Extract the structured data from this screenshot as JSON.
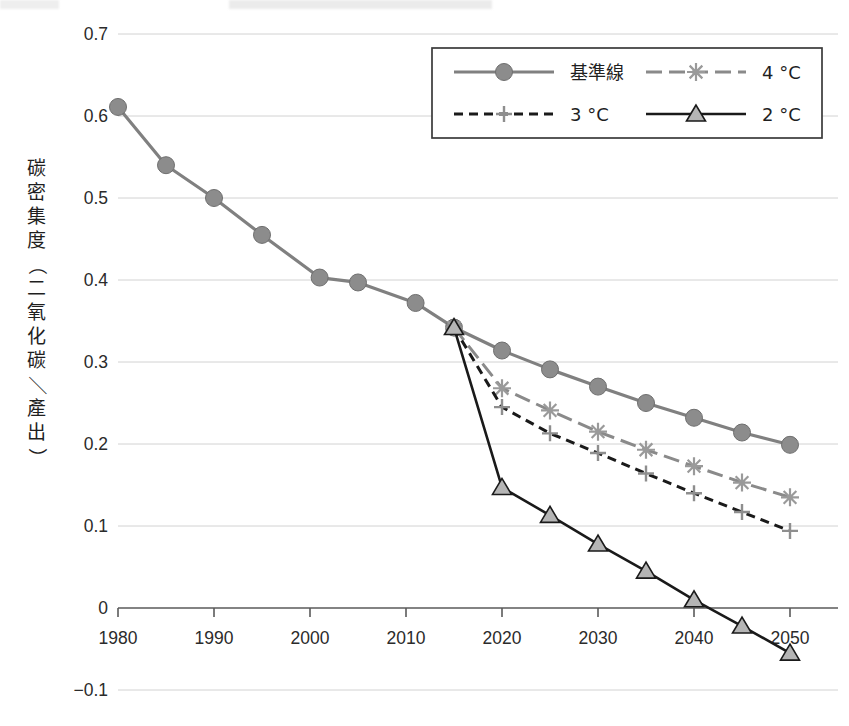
{
  "chart_data": {
    "type": "line",
    "title": "",
    "xlabel": "",
    "ylabel": "碳密集度（二氧化碳／產出）",
    "xlim": [
      1980,
      2050
    ],
    "ylim": [
      -0.1,
      0.7
    ],
    "xticks": [
      "1980",
      "1990",
      "2000",
      "2010",
      "2020",
      "2030",
      "2040",
      "2050"
    ],
    "xtick_values": [
      1980,
      1990,
      2000,
      2010,
      2020,
      2030,
      2040,
      2050
    ],
    "yticks": [
      "0.7",
      "0.6",
      "0.5",
      "0.4",
      "0.3",
      "0.2",
      "0.1",
      "0",
      "-0.1"
    ],
    "ytick_values": [
      0.7,
      0.6,
      0.5,
      0.4,
      0.3,
      0.2,
      0.1,
      0,
      -0.1
    ],
    "grid": "horizontal",
    "legend_position": "top-right",
    "series": [
      {
        "name": "基準線",
        "marker": "circle",
        "linestyle": "solid",
        "color": "#808080",
        "x": [
          1980,
          1985,
          1990,
          1995,
          2001,
          2005,
          2011,
          2015,
          2020,
          2025,
          2030,
          2035,
          2040,
          2045,
          2050
        ],
        "values": [
          0.611,
          0.54,
          0.5,
          0.455,
          0.403,
          0.397,
          0.372,
          0.342,
          0.314,
          0.291,
          0.27,
          0.25,
          0.232,
          0.214,
          0.199
        ]
      },
      {
        "name": "4 °C",
        "marker": "asterisk",
        "linestyle": "dashed",
        "color": "#8a8a8a",
        "x": [
          2015,
          2020,
          2025,
          2030,
          2035,
          2040,
          2045,
          2050
        ],
        "values": [
          0.342,
          0.268,
          0.241,
          0.215,
          0.193,
          0.173,
          0.153,
          0.135
        ]
      },
      {
        "name": "3 °C",
        "marker": "plus",
        "linestyle": "dotted",
        "color": "#1a1a1a",
        "x": [
          2015,
          2020,
          2025,
          2030,
          2035,
          2040,
          2045,
          2050
        ],
        "values": [
          0.342,
          0.245,
          0.213,
          0.189,
          0.164,
          0.14,
          0.117,
          0.094
        ]
      },
      {
        "name": "2 °C",
        "marker": "triangle",
        "linestyle": "solid",
        "color": "#1a1a1a",
        "x": [
          2015,
          2020,
          2025,
          2030,
          2035,
          2040,
          2045,
          2050
        ],
        "values": [
          0.342,
          0.147,
          0.113,
          0.078,
          0.045,
          0.01,
          -0.022,
          -0.055
        ]
      }
    ]
  },
  "legend": {
    "items": [
      {
        "label": "基準線",
        "marker": "circle-icon"
      },
      {
        "label": "4 °C",
        "marker": "asterisk-icon"
      },
      {
        "label": "3 °C",
        "marker": "plus-icon"
      },
      {
        "label": "2 °C",
        "marker": "triangle-icon"
      }
    ]
  },
  "axis": {
    "y_label_chars": [
      "碳",
      "密",
      "集",
      "度",
      "（",
      "二",
      "氧",
      "化",
      "碳",
      "／",
      "產",
      "出",
      "）"
    ]
  }
}
